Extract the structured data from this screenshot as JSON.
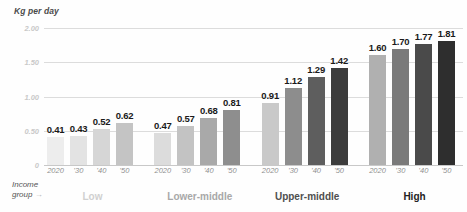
{
  "chart_data": {
    "type": "bar",
    "title": "",
    "ylabel": "Kg per day",
    "xlabel": "Income group",
    "ylim": [
      0,
      2.0
    ],
    "grid": true,
    "legend": "none",
    "ytick_labels": [
      "2.00",
      "1.50",
      "1.00",
      "0.50",
      "0"
    ],
    "ytick_values": [
      2.0,
      1.5,
      1.0,
      0.5,
      0
    ],
    "x": [
      "2020",
      "'30",
      "'40",
      "'50"
    ],
    "categories": [
      "Low",
      "Lower-middle",
      "Upper-middle",
      "High"
    ],
    "series": [
      {
        "name": "Low",
        "values": [
          0.41,
          0.43,
          0.52,
          0.62
        ]
      },
      {
        "name": "Lower-middle",
        "values": [
          0.47,
          0.57,
          0.68,
          0.81
        ]
      },
      {
        "name": "Upper-middle",
        "values": [
          0.91,
          1.12,
          1.29,
          1.42
        ]
      },
      {
        "name": "High",
        "values": [
          1.6,
          1.7,
          1.77,
          1.81
        ]
      }
    ],
    "value_labels": [
      [
        "0.41",
        "0.43",
        "0.52",
        "0.62"
      ],
      [
        "0.47",
        "0.57",
        "0.68",
        "0.81"
      ],
      [
        "0.91",
        "1.12",
        "1.29",
        "1.42"
      ],
      [
        "1.60",
        "1.70",
        "1.77",
        "1.81"
      ]
    ],
    "bar_colors": [
      [
        "#ededed",
        "#e3e3e3",
        "#d6d6d6",
        "#c4c4c4"
      ],
      [
        "#dcdcdc",
        "#c3c3c3",
        "#a9a9a9",
        "#8e8e8e"
      ],
      [
        "#c9c9c9",
        "#8d8d8d",
        "#5e5e5e",
        "#3c3c3c"
      ],
      [
        "#b0b0b0",
        "#7a7a7a",
        "#4a4a4a",
        "#2e2e2e"
      ]
    ],
    "group_label_colors": [
      "#d0d0d0",
      "#a8a8a8",
      "#4f4f4f",
      "#222222"
    ],
    "arrow_glyph": "→",
    "income_line1": "Income",
    "income_line2": "group",
    "gridline_color": "#dcdcdc",
    "background": "#fefefe"
  }
}
